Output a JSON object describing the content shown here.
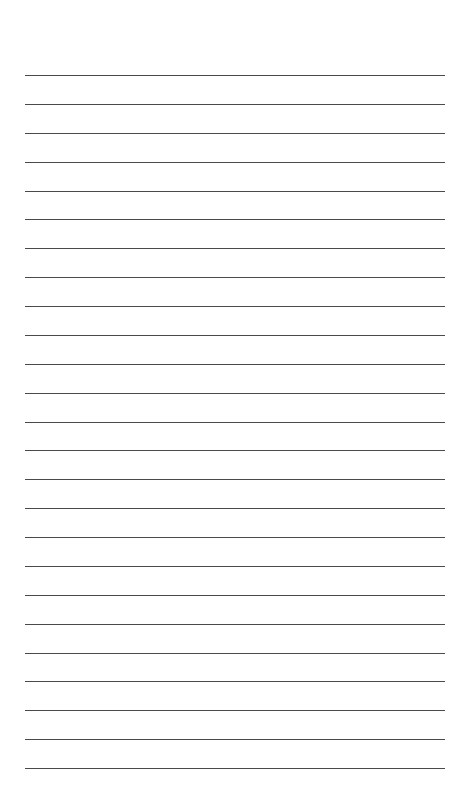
{
  "page": {
    "type": "lined-paper",
    "background_color": "#ffffff",
    "line_color": "#4a4a4a",
    "line_count": 25,
    "first_line_y": 75,
    "line_spacing": 28.875,
    "line_left": 25,
    "line_width": 420
  }
}
